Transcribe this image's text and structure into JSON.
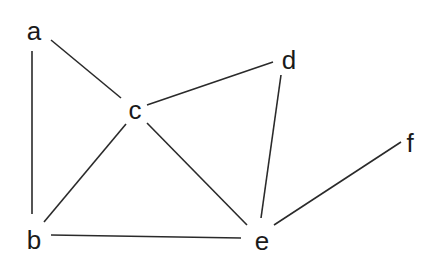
{
  "graph": {
    "type": "undirected",
    "nodes": [
      {
        "id": "a",
        "label": "a",
        "x": 34,
        "y": 31
      },
      {
        "id": "b",
        "label": "b",
        "x": 34,
        "y": 240
      },
      {
        "id": "c",
        "label": "c",
        "x": 135,
        "y": 110
      },
      {
        "id": "d",
        "label": "d",
        "x": 289,
        "y": 60
      },
      {
        "id": "e",
        "label": "e",
        "x": 262,
        "y": 243
      },
      {
        "id": "f",
        "label": "f",
        "x": 410,
        "y": 143
      }
    ],
    "edges": [
      {
        "from": "a",
        "to": "b",
        "x1": 32,
        "y1": 51,
        "x2": 32,
        "y2": 214
      },
      {
        "from": "a",
        "to": "c",
        "x1": 51,
        "y1": 40,
        "x2": 121,
        "y2": 98
      },
      {
        "from": "c",
        "to": "d",
        "x1": 147,
        "y1": 105,
        "x2": 273,
        "y2": 62
      },
      {
        "from": "c",
        "to": "b",
        "x1": 126,
        "y1": 124,
        "x2": 44,
        "y2": 222
      },
      {
        "from": "c",
        "to": "e",
        "x1": 147,
        "y1": 123,
        "x2": 247,
        "y2": 225
      },
      {
        "from": "d",
        "to": "e",
        "x1": 281,
        "y1": 75,
        "x2": 261,
        "y2": 218
      },
      {
        "from": "b",
        "to": "e",
        "x1": 51,
        "y1": 235,
        "x2": 241,
        "y2": 238
      },
      {
        "from": "e",
        "to": "f",
        "x1": 274,
        "y1": 225,
        "x2": 401,
        "y2": 142
      }
    ]
  }
}
